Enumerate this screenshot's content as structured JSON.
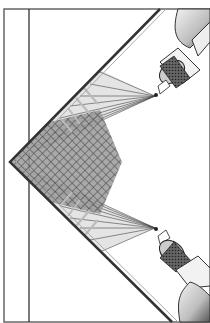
{
  "illustration": {
    "subject": "Two spray guns spraying paint into an inside corner with overlapping spray patterns",
    "colors": {
      "background": "#ffffff",
      "ink": "#2a2a2a",
      "mid_gray": "#8a8a8a",
      "light_gray": "#d0d0d0",
      "frame": "#555555"
    },
    "elements": {
      "frame_border": "frame",
      "corner_wall": "inside corner",
      "upper_spray_gun": "spray gun (upper)",
      "lower_spray_gun": "spray gun (lower)",
      "upper_spray_fan": "spray fan (upper)",
      "lower_spray_fan": "spray fan (lower)",
      "overlap_region": "overlapping spray pattern"
    }
  }
}
